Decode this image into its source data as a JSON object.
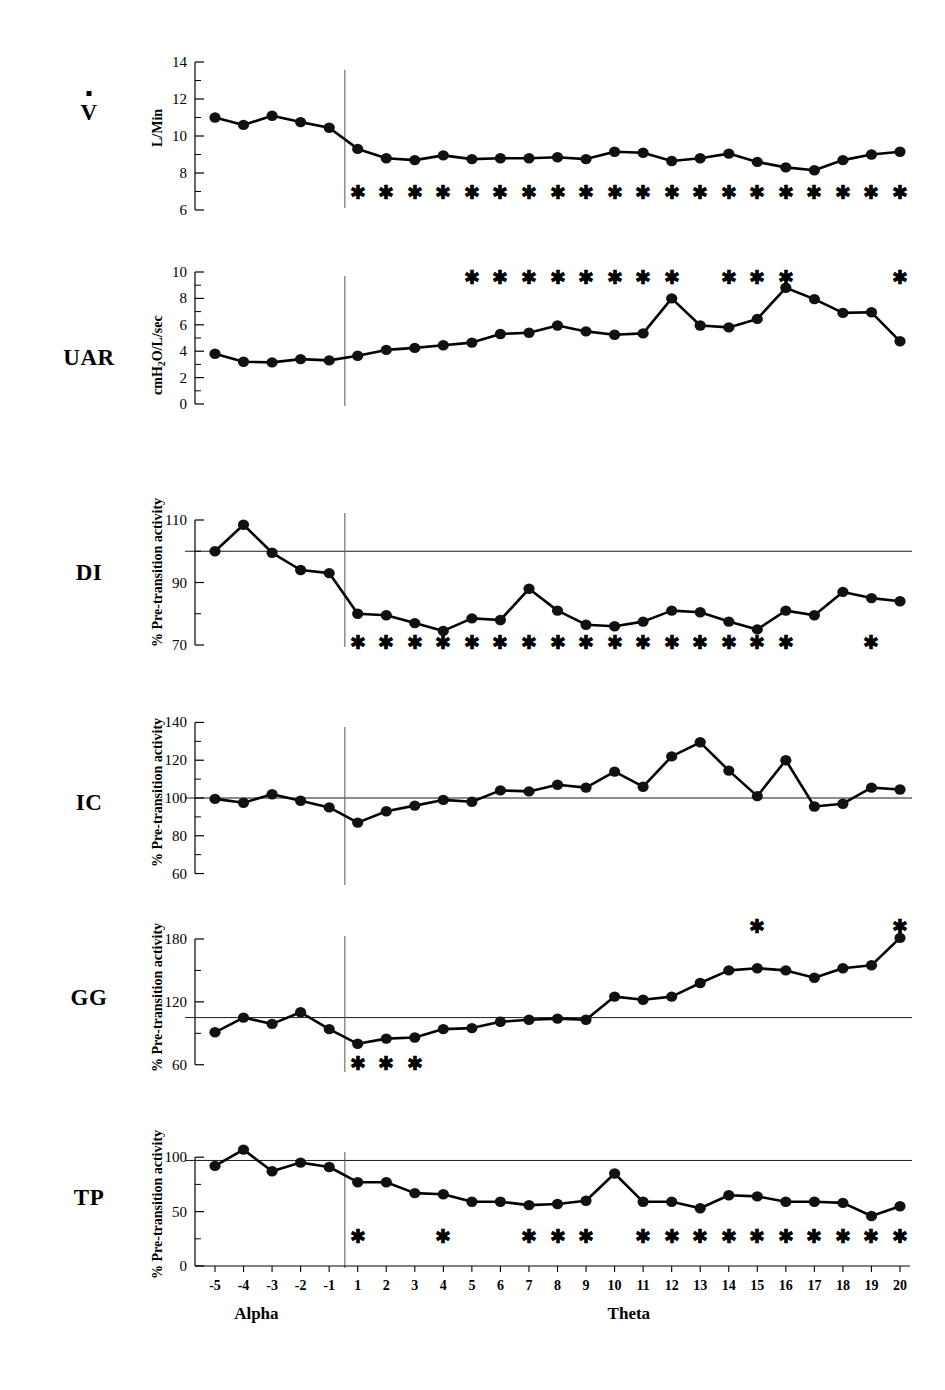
{
  "figure": {
    "x_axis": {
      "tick_labels": [
        "-5",
        "-4",
        "-3",
        "-2",
        "-1",
        "1",
        "2",
        "3",
        "4",
        "5",
        "6",
        "7",
        "8",
        "9",
        "10",
        "11",
        "12",
        "13",
        "14",
        "15",
        "16",
        "17",
        "18",
        "19",
        "20"
      ],
      "phase_left": "Alpha",
      "phase_right": "Theta"
    }
  },
  "chart_data": [
    {
      "type": "line",
      "panel_label": "V",
      "panel_label_has_dot": true,
      "ylabel": "L/Min",
      "title": "",
      "xlabel": "",
      "x": [
        "-5",
        "-4",
        "-3",
        "-2",
        "-1",
        "1",
        "2",
        "3",
        "4",
        "5",
        "6",
        "7",
        "8",
        "9",
        "10",
        "11",
        "12",
        "13",
        "14",
        "15",
        "16",
        "17",
        "18",
        "19",
        "20"
      ],
      "values": [
        11.0,
        10.6,
        11.1,
        10.75,
        10.45,
        9.3,
        8.8,
        8.7,
        8.95,
        8.75,
        8.8,
        8.8,
        8.85,
        8.75,
        9.15,
        9.1,
        8.65,
        8.8,
        9.05,
        8.6,
        8.3,
        8.15,
        8.7,
        9.0,
        9.15
      ],
      "ylim": [
        6,
        14
      ],
      "yticks": [
        6,
        8,
        10,
        12,
        14
      ],
      "ytick_labels": [
        "6",
        "8",
        "10",
        "12",
        "14"
      ],
      "minor_yticks": [
        7,
        9,
        11,
        13
      ],
      "reference_line": null,
      "stars": [
        "1",
        "2",
        "3",
        "4",
        "5",
        "6",
        "7",
        "8",
        "9",
        "10",
        "11",
        "12",
        "13",
        "14",
        "15",
        "16",
        "17",
        "18",
        "19",
        "20"
      ],
      "star_value": 7.0,
      "grid": false
    },
    {
      "type": "line",
      "panel_label": "UAR",
      "panel_label_has_dot": false,
      "ylabel": "cmH2O/L/sec",
      "ylabel_parts": [
        "cmH",
        "2",
        "O/L/sec"
      ],
      "title": "",
      "xlabel": "",
      "x": [
        "-5",
        "-4",
        "-3",
        "-2",
        "-1",
        "1",
        "2",
        "3",
        "4",
        "5",
        "6",
        "7",
        "8",
        "9",
        "10",
        "11",
        "12",
        "13",
        "14",
        "15",
        "16",
        "17",
        "18",
        "19",
        "20"
      ],
      "values": [
        3.8,
        3.2,
        3.15,
        3.4,
        3.3,
        3.65,
        4.1,
        4.25,
        4.45,
        4.65,
        5.3,
        5.4,
        5.95,
        5.5,
        5.25,
        5.35,
        8.0,
        5.95,
        5.8,
        6.45,
        8.8,
        7.95,
        6.9,
        6.95,
        4.75
      ],
      "ylim": [
        0,
        10
      ],
      "yticks": [
        0,
        2,
        4,
        6,
        8,
        10
      ],
      "ytick_labels": [
        "0",
        "2",
        "4",
        "6",
        "8",
        "10"
      ],
      "minor_yticks": [
        1,
        3,
        5,
        7,
        9
      ],
      "reference_line": null,
      "stars": [
        "5",
        "6",
        "7",
        "8",
        "9",
        "10",
        "11",
        "12",
        "14",
        "15",
        "16",
        "20"
      ],
      "star_value": 9.6,
      "grid": false
    },
    {
      "type": "line",
      "panel_label": "DI",
      "panel_label_has_dot": false,
      "ylabel": "% Pre-transition activity",
      "title": "",
      "xlabel": "",
      "x": [
        "-5",
        "-4",
        "-3",
        "-2",
        "-1",
        "1",
        "2",
        "3",
        "4",
        "5",
        "6",
        "7",
        "8",
        "9",
        "10",
        "11",
        "12",
        "13",
        "14",
        "15",
        "16",
        "17",
        "18",
        "19",
        "20"
      ],
      "values": [
        100,
        108.5,
        99.5,
        94,
        93,
        80,
        79.5,
        77,
        74.5,
        78.5,
        78,
        88,
        81,
        76.5,
        76,
        77.5,
        81,
        80.5,
        77.5,
        75,
        81,
        79.5,
        87,
        85,
        84,
        90
      ],
      "ylim": [
        70,
        118
      ],
      "yticks": [
        70,
        90,
        110
      ],
      "ytick_labels": [
        "70",
        "90",
        "110"
      ],
      "minor_yticks": [
        80,
        100
      ],
      "reference_line": 100,
      "stars": [
        "1",
        "2",
        "3",
        "4",
        "5",
        "6",
        "7",
        "8",
        "9",
        "10",
        "11",
        "12",
        "13",
        "14",
        "15",
        "16",
        "19"
      ],
      "star_value": 71,
      "grid": false
    },
    {
      "type": "line",
      "panel_label": "IC",
      "panel_label_has_dot": false,
      "ylabel": "% Pre-transition activity",
      "title": "",
      "xlabel": "",
      "x": [
        "-5",
        "-4",
        "-3",
        "-2",
        "-1",
        "1",
        "2",
        "3",
        "4",
        "5",
        "6",
        "7",
        "8",
        "9",
        "10",
        "11",
        "12",
        "13",
        "14",
        "15",
        "16",
        "17",
        "18",
        "19",
        "20"
      ],
      "values": [
        99.5,
        97.5,
        102,
        98.5,
        95,
        87,
        93,
        96,
        99,
        98,
        104,
        103.5,
        107,
        105.5,
        114,
        106,
        122,
        129.5,
        114.5,
        101,
        120,
        95.5,
        97,
        105.5,
        104.5
      ],
      "ylim": [
        55,
        145
      ],
      "yticks": [
        60,
        80,
        100,
        120,
        140
      ],
      "ytick_labels": [
        "60",
        "80",
        "100",
        "120",
        "140"
      ],
      "minor_yticks": [
        70,
        90,
        110,
        130
      ],
      "reference_line": 100,
      "stars": [],
      "star_value": null,
      "grid": false
    },
    {
      "type": "line",
      "panel_label": "GG",
      "panel_label_has_dot": false,
      "ylabel": "% Pre-transition activity",
      "title": "",
      "xlabel": "",
      "x": [
        "-5",
        "-4",
        "-3",
        "-2",
        "-1",
        "1",
        "2",
        "3",
        "4",
        "5",
        "6",
        "7",
        "8",
        "9",
        "10",
        "11",
        "12",
        "13",
        "14",
        "15",
        "16",
        "17",
        "18",
        "19",
        "20"
      ],
      "values": [
        91,
        105,
        99,
        110,
        94,
        80,
        85,
        86,
        94,
        95,
        98,
        100,
        101,
        102,
        103,
        125,
        122,
        125,
        138,
        150,
        152,
        150,
        143,
        152,
        155,
        181
      ],
      "values_actual": [
        91,
        105,
        99,
        110,
        94,
        80,
        85,
        86,
        94,
        95,
        101,
        103,
        104,
        103,
        125,
        122,
        125,
        138,
        150,
        152,
        150,
        143,
        152,
        155,
        181
      ],
      "ylim": [
        55,
        200
      ],
      "yticks": [
        60,
        120,
        180
      ],
      "ytick_labels": [
        "60",
        "120",
        "180"
      ],
      "minor_yticks": [
        90,
        150
      ],
      "reference_line": 105,
      "stars_below": [
        "1",
        "2",
        "3"
      ],
      "stars_above": [
        "15",
        "20"
      ],
      "star_below_value": 62,
      "star_above_value": 192,
      "grid": false
    },
    {
      "type": "line",
      "panel_label": "TP",
      "panel_label_has_dot": false,
      "ylabel": "% Pre-transition activity",
      "title": "",
      "xlabel": "",
      "x": [
        "-5",
        "-4",
        "-3",
        "-2",
        "-1",
        "1",
        "2",
        "3",
        "4",
        "5",
        "6",
        "7",
        "8",
        "9",
        "10",
        "11",
        "12",
        "13",
        "14",
        "15",
        "16",
        "17",
        "18",
        "19",
        "20"
      ],
      "values": [
        92,
        107,
        87,
        95,
        91,
        77,
        77,
        67,
        66,
        59,
        59,
        56,
        57,
        60,
        85,
        59,
        59,
        53,
        65,
        64,
        59,
        59,
        58,
        46,
        55
      ],
      "ylim": [
        0,
        125
      ],
      "yticks": [
        0,
        50,
        100
      ],
      "ytick_labels": [
        "0",
        "50",
        "100"
      ],
      "minor_yticks": [
        25,
        75
      ],
      "reference_line": 97,
      "stars": [
        "1",
        "4",
        "7",
        "8",
        "9",
        "11",
        "12",
        "13",
        "14",
        "15",
        "16",
        "17",
        "18",
        "19",
        "20"
      ],
      "star_value": 28,
      "grid": false
    }
  ]
}
